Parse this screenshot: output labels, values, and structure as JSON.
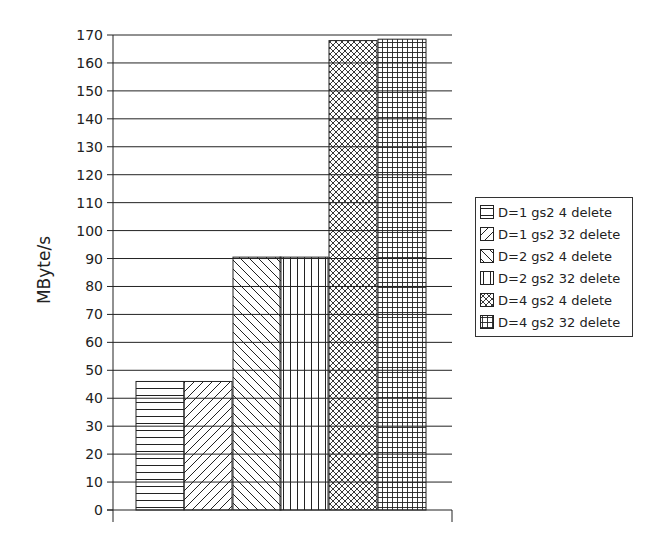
{
  "chart_data": {
    "type": "bar",
    "title": "",
    "xlabel": "",
    "ylabel": "MByte/s",
    "ylim": [
      0,
      170
    ],
    "yticks": [
      0,
      10,
      20,
      30,
      40,
      50,
      60,
      70,
      80,
      90,
      100,
      110,
      120,
      130,
      140,
      150,
      160,
      170
    ],
    "grid": true,
    "legend_position": "right",
    "categories": [
      ""
    ],
    "series": [
      {
        "name": "D=1 gs2 4 delete",
        "values": [
          46
        ],
        "pattern": "horizontal"
      },
      {
        "name": "D=1 gs2 32 delete",
        "values": [
          46
        ],
        "pattern": "diag-up"
      },
      {
        "name": "D=2 gs2 4 delete",
        "values": [
          90.5
        ],
        "pattern": "diag-down"
      },
      {
        "name": "D=2 gs2 32 delete",
        "values": [
          90.5
        ],
        "pattern": "vertical"
      },
      {
        "name": "D=4 gs2 4 delete",
        "values": [
          168
        ],
        "pattern": "crosshatch"
      },
      {
        "name": "D=4 gs2 32 delete",
        "values": [
          168.5
        ],
        "pattern": "grid"
      }
    ]
  },
  "colors": {
    "line": "#222222",
    "background": "#ffffff"
  }
}
